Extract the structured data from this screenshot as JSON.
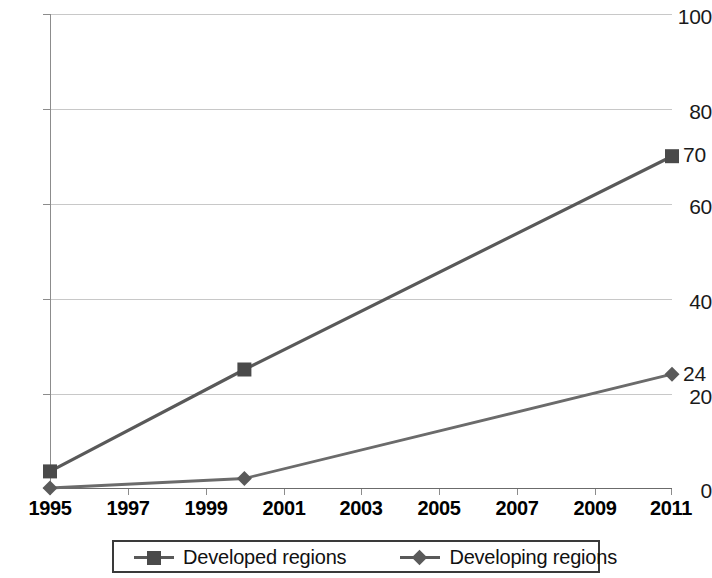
{
  "chart_data": {
    "type": "line",
    "title": "",
    "subtitle": "",
    "xlabel": "",
    "ylabel": "",
    "xlim": [
      1995,
      2011
    ],
    "ylim": [
      0,
      100
    ],
    "grid": true,
    "legend_position": "bottom",
    "x": [
      1995,
      2000,
      2011
    ],
    "xtick_labels": [
      "1995",
      "1997",
      "1999",
      "2001",
      "2003",
      "2005",
      "2007",
      "2009",
      "2011"
    ],
    "xtick_values": [
      1995,
      1997,
      1999,
      2001,
      2003,
      2005,
      2007,
      2009,
      2011
    ],
    "ytick_labels": [
      "0",
      "20",
      "40",
      "60",
      "80",
      "100"
    ],
    "ytick_values": [
      0,
      20,
      40,
      60,
      80,
      100
    ],
    "series": [
      {
        "name": "Developed regions",
        "marker": "square",
        "color": "#595959",
        "marker_color": "#4a4a4a",
        "x": [
          1995,
          2000,
          2011
        ],
        "values": [
          3.5,
          25,
          70
        ],
        "end_label": "70"
      },
      {
        "name": "Developing regions",
        "marker": "diamond",
        "color": "#6b6b6b",
        "marker_color": "#5a5a5a",
        "x": [
          1995,
          2000,
          2011
        ],
        "values": [
          0,
          2,
          24
        ],
        "end_label": "24"
      }
    ],
    "annotations": [
      {
        "text": "70",
        "x": 2011,
        "y": 70
      },
      {
        "text": "24",
        "x": 2011,
        "y": 24
      }
    ]
  },
  "axes": {
    "y_labels": [
      "100",
      "80",
      "60",
      "40",
      "20",
      "0"
    ],
    "x_labels": [
      "1995",
      "1997",
      "1999",
      "2001",
      "2003",
      "2005",
      "2007",
      "2009",
      "2011"
    ]
  },
  "legend": {
    "entries": [
      {
        "label": "Developed regions",
        "marker": "square-marker-icon"
      },
      {
        "label": "Developing regions",
        "marker": "diamond-marker-icon"
      }
    ]
  },
  "colors": {
    "grid": "#c8c8c8",
    "axis": "#8c8c8c",
    "series_developed": "#595959",
    "series_developing": "#6b6b6b",
    "text": "#111111",
    "background": "#ffffff"
  },
  "point_labels": {
    "developed_end": "70",
    "developing_end": "24"
  }
}
